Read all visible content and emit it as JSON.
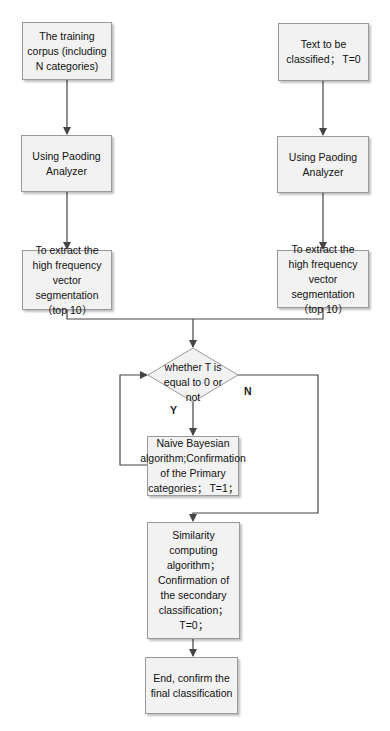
{
  "diagram": {
    "type": "flowchart",
    "nodes": {
      "train_corpus": "The training corpus (including N categories)",
      "text_input": "Text to be classified； T=0",
      "paoding_left": "Using Paoding Analyzer",
      "paoding_right": "Using Paoding Analyzer",
      "extract_left": "To extract the high frequency vector segmentation（top 10）",
      "extract_right": "To extract the high frequency vector segmentation（top 10）",
      "decision": "whether T is equal to 0 or not",
      "naive_bayes": "Naive Bayesian algorithm;Confirmation of the Primary categories； T=1；",
      "similarity": "Similarity computing algorithm； Confirmation of the secondary classification； T=0；",
      "end": "End, confirm the final classification"
    },
    "edge_labels": {
      "yes": "Y",
      "no": "N"
    },
    "edges": [
      {
        "from": "train_corpus",
        "to": "paoding_left"
      },
      {
        "from": "paoding_left",
        "to": "extract_left"
      },
      {
        "from": "text_input",
        "to": "paoding_right"
      },
      {
        "from": "paoding_right",
        "to": "extract_right"
      },
      {
        "from": "extract_left",
        "to": "decision"
      },
      {
        "from": "extract_right",
        "to": "decision"
      },
      {
        "from": "decision",
        "to": "naive_bayes",
        "label": "Y"
      },
      {
        "from": "decision",
        "to": "similarity",
        "label": "N"
      },
      {
        "from": "naive_bayes",
        "to": "decision"
      },
      {
        "from": "similarity",
        "to": "end"
      }
    ],
    "colors": {
      "box_fill": "#f2f2f2",
      "box_border": "#9a9a9a",
      "line": "#444444"
    }
  }
}
